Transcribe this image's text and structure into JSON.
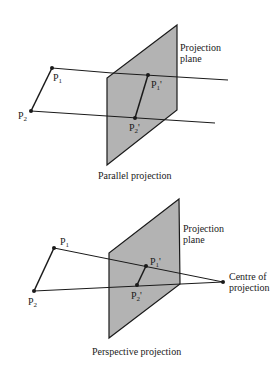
{
  "diagrams": [
    {
      "caption": "Parallel projection",
      "plane_label_1": "Projection",
      "plane_label_2": "plane",
      "points": {
        "p1": "P",
        "p1_sub": "1",
        "p2": "P",
        "p2_sub": "2",
        "p1p": "P",
        "p1p_sub": "1",
        "p1p_prime": "'",
        "p2p": "P",
        "p2p_sub": "2",
        "p2p_prime": "'"
      }
    },
    {
      "caption": "Perspective projection",
      "plane_label_1": "Projection",
      "plane_label_2": "plane",
      "centre_label_1": "Centre of",
      "centre_label_2": "projection",
      "points": {
        "p1": "P",
        "p1_sub": "1",
        "p2": "P",
        "p2_sub": "2",
        "p1p": "P",
        "p1p_sub": "1",
        "p1p_prime": "'",
        "p2p": "P",
        "p2p_sub": "2",
        "p2p_prime": "'"
      }
    }
  ],
  "colors": {
    "plane_fill": "#b3b3b3",
    "line": "#1a1a1a"
  }
}
